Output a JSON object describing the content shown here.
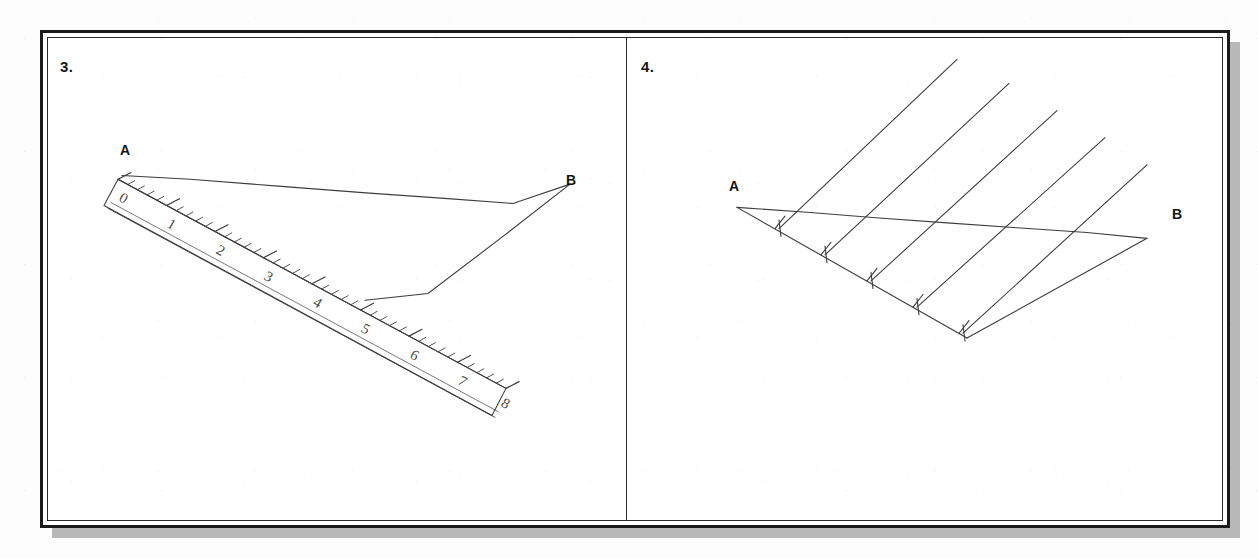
{
  "page": {
    "background_color": "#fdfdfd",
    "frame_border_color": "#1b1b1b",
    "shadow_color": "#b9b9b9",
    "ink_color": "#3a3a3a"
  },
  "panels": [
    {
      "number_label": "3.",
      "name": "ruler-measuring-segment",
      "point_a_label": "A",
      "point_b_label": "B",
      "ruler": {
        "tick_numbers": [
          "0",
          "1",
          "2",
          "3",
          "4",
          "5",
          "6",
          "7",
          "8"
        ],
        "measured_value": "5",
        "units_shown": 8,
        "minor_ticks_per_unit": 10
      }
    },
    {
      "number_label": "4.",
      "name": "equal-division-construction",
      "point_a_label": "A",
      "point_b_label": "B",
      "construction": {
        "division_tick_count": 5,
        "parallel_line_count": 5
      }
    }
  ]
}
